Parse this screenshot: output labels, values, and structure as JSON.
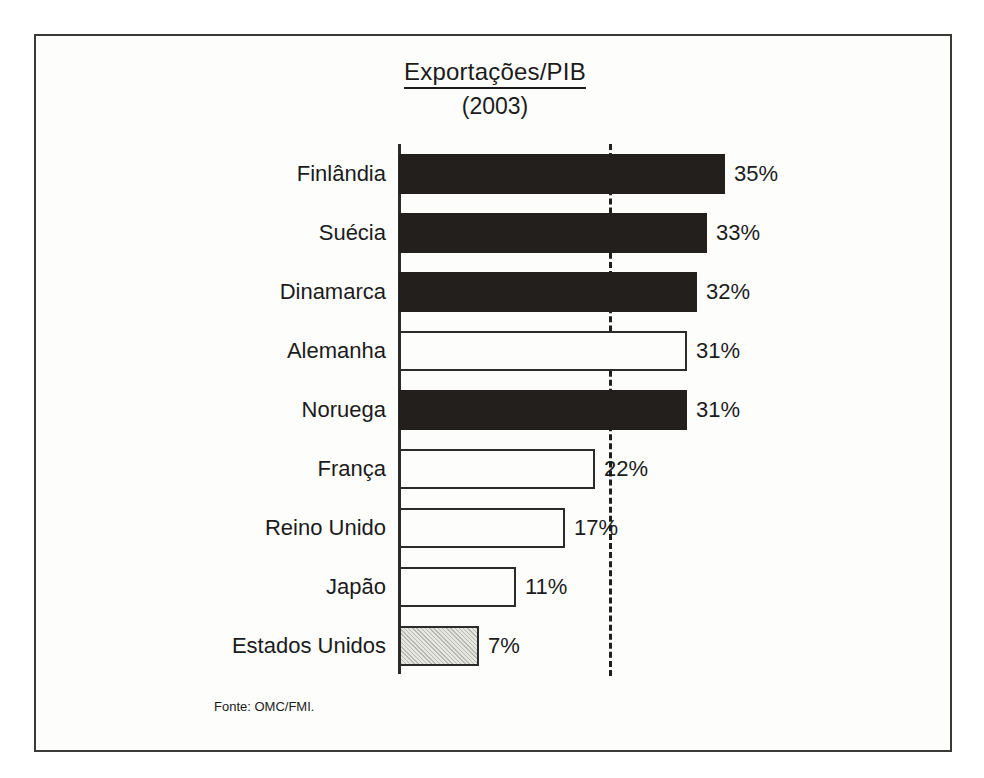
{
  "figure": {
    "title": "Exportações/PIB",
    "subtitle": "(2003)",
    "source_note": "Fonte: OMC/FMI."
  },
  "chart_data": {
    "type": "bar",
    "orientation": "horizontal",
    "title": "Exportações/PIB",
    "subtitle": "(2003)",
    "xlabel": "",
    "ylabel": "",
    "xlim": [
      0,
      40
    ],
    "grid": false,
    "legend": "none",
    "value_suffix": "%",
    "reference_line": {
      "value": 27,
      "style": "dashed",
      "color": "#1f1f1d",
      "orientation": "vertical"
    },
    "categories": [
      "Finlândia",
      "Suécia",
      "Dinamarca",
      "Alemanha",
      "Noruega",
      "França",
      "Reino Unido",
      "Japão",
      "Estados Unidos"
    ],
    "values": [
      35,
      33,
      32,
      31,
      31,
      22,
      17,
      11,
      7
    ],
    "value_labels": [
      "35%",
      "33%",
      "32%",
      "31%",
      "31%",
      "22%",
      "17%",
      "11%",
      "7%"
    ],
    "bar_styles": [
      "dark",
      "dark",
      "dark",
      "white",
      "dark",
      "white",
      "white",
      "white",
      "gray"
    ],
    "colors": {
      "dark": "#231f1c",
      "white": "#fdfdfb",
      "gray": "#e6e6e0",
      "outline": "#2b2b29",
      "text": "#1b1b1b"
    },
    "source": "Fonte: OMC/FMI."
  },
  "bars": [
    {
      "label": "Finlândia",
      "value_label": "35%",
      "width_px": 326,
      "style": "fill-dark"
    },
    {
      "label": "Suécia",
      "value_label": "33%",
      "width_px": 308,
      "style": "fill-dark"
    },
    {
      "label": "Dinamarca",
      "value_label": "32%",
      "width_px": 298,
      "style": "fill-dark"
    },
    {
      "label": "Alemanha",
      "value_label": "31%",
      "width_px": 288,
      "style": "fill-white"
    },
    {
      "label": "Noruega",
      "value_label": "31%",
      "width_px": 288,
      "style": "fill-dark"
    },
    {
      "label": "França",
      "value_label": "22%",
      "width_px": 196,
      "style": "fill-white"
    },
    {
      "label": "Reino Unido",
      "value_label": "17%",
      "width_px": 166,
      "style": "fill-white"
    },
    {
      "label": "Japão",
      "value_label": "11%",
      "width_px": 117,
      "style": "fill-white"
    },
    {
      "label": "Estados Unidos",
      "value_label": "7%",
      "width_px": 80,
      "style": "fill-gray"
    }
  ]
}
